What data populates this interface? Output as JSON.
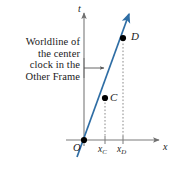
{
  "figure": {
    "kind": "spacetime-diagram",
    "background": "#ffffff",
    "caption": {
      "lines": [
        "Worldline of",
        "the center",
        "clock in the",
        "Other Frame"
      ],
      "align": "right",
      "leader": "horizontal arrow pointing right to the worldline"
    },
    "axes": {
      "color": "#7a7a7a",
      "vertical": {
        "label": "t",
        "name": "time-axis"
      },
      "horizontal": {
        "label": "x",
        "name": "space-axis"
      },
      "origin_label": "O"
    },
    "worldline": {
      "color": "#2e6da4",
      "label": "worldline of the center clock in the Other Frame",
      "has_arrowhead": true
    },
    "events": [
      {
        "id": "C",
        "label": "C",
        "x_label": "x",
        "x_sub": "C",
        "cx": 105,
        "cy": 98
      },
      {
        "id": "D",
        "label": "D",
        "x_label": "x",
        "x_sub": "D",
        "cx": 123,
        "cy": 38
      }
    ],
    "origin_point": {
      "id": "O",
      "label": "O",
      "cx": 84,
      "cy": 140
    },
    "tick_labels": [
      {
        "base": "x",
        "sub": "C"
      },
      {
        "base": "x",
        "sub": "D"
      }
    ],
    "dropline_style": "dotted",
    "point_color": "#000000"
  }
}
